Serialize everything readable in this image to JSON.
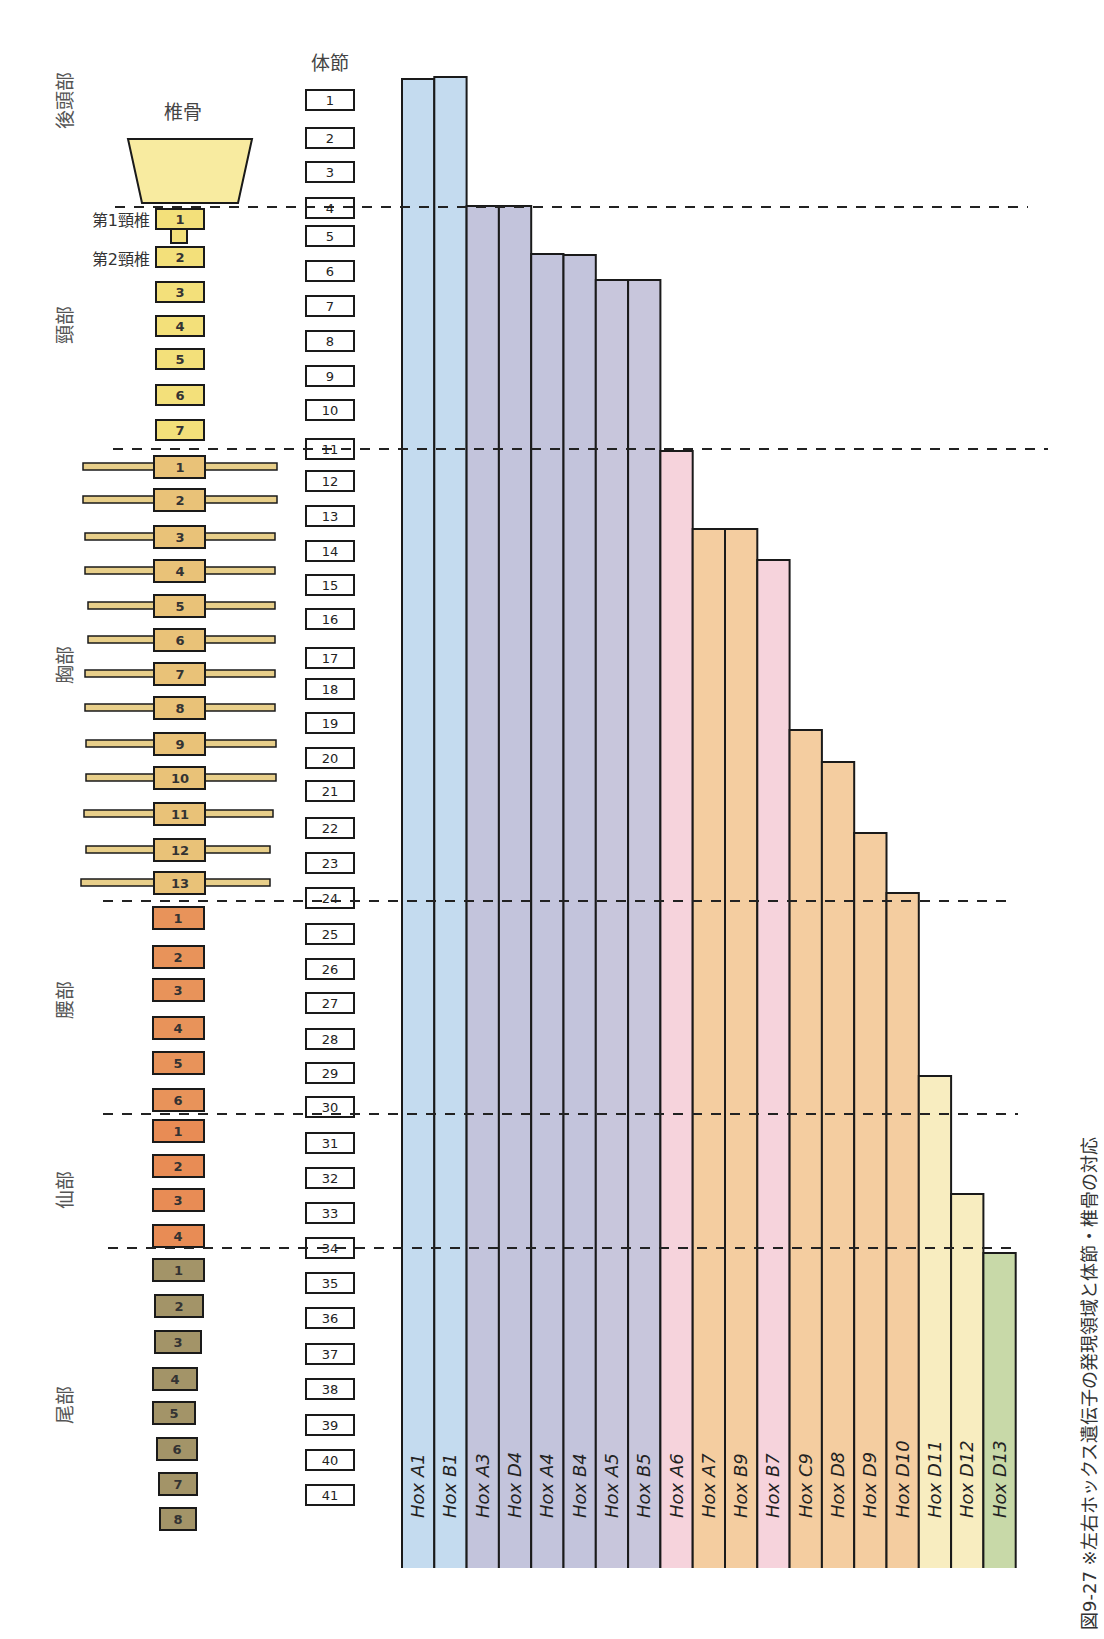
{
  "headers": {
    "vertebra_column": "椎骨",
    "segment_column": "体節"
  },
  "cervical_labels": {
    "c1": "第1頸椎",
    "c2": "第2頸椎"
  },
  "caption_fragment": "図9-27 ※左右ホックス遺伝子の発現領域と体節・椎骨の対応",
  "colors": {
    "occipital": "#f8eba0",
    "cervical": "#f3e07a",
    "thoracic": "#e9c278",
    "lumbar": "#e8935a",
    "sacral": "#e88c55",
    "caudal": "#a39468",
    "rib": "#e8cf8a",
    "hox1": "#c4dbef",
    "hox3_5": "#c3c4dc",
    "hox6_7": "#f6d3dc",
    "hox_orange": "#f4cda0",
    "hox_d11_12": "#f8edc0",
    "hox_d13": "#c8d9a8",
    "outline": "#1a1a1a"
  },
  "regions": [
    {
      "name": "後頭部",
      "first_segment": 1,
      "last_segment": 4
    },
    {
      "name": "頸部",
      "first_segment": 5,
      "last_segment": 11
    },
    {
      "name": "胸部",
      "first_segment": 12,
      "last_segment": 24
    },
    {
      "name": "腰部",
      "first_segment": 25,
      "last_segment": 30
    },
    {
      "name": "仙部",
      "first_segment": 31,
      "last_segment": 34
    },
    {
      "name": "尾部",
      "first_segment": 35,
      "last_segment": 41
    }
  ],
  "vertebrae": {
    "cervical": [
      "1",
      "2",
      "3",
      "4",
      "5",
      "6",
      "7"
    ],
    "thoracic": [
      "1",
      "2",
      "3",
      "4",
      "5",
      "6",
      "7",
      "8",
      "9",
      "10",
      "11",
      "12",
      "13"
    ],
    "lumbar": [
      "1",
      "2",
      "3",
      "4",
      "5",
      "6"
    ],
    "sacral": [
      "1",
      "2",
      "3",
      "4"
    ],
    "caudal": [
      "1",
      "2",
      "3",
      "4",
      "5",
      "6",
      "7",
      "8"
    ]
  },
  "segments": [
    "1",
    "2",
    "3",
    "4",
    "5",
    "6",
    "7",
    "8",
    "9",
    "10",
    "11",
    "12",
    "13",
    "14",
    "15",
    "16",
    "17",
    "18",
    "19",
    "20",
    "21",
    "22",
    "23",
    "24",
    "25",
    "26",
    "27",
    "28",
    "29",
    "30",
    "31",
    "32",
    "33",
    "34",
    "35",
    "36",
    "37",
    "38",
    "39",
    "40",
    "41"
  ],
  "boundaries": [
    4,
    11,
    24,
    30,
    34
  ],
  "chart_data": {
    "type": "bar",
    "title": "",
    "xlabel": "Hox遺伝子",
    "ylabel": "体節 (anterior expression limit)",
    "orientation": "vertical bars hanging from posterior end; bar top = anterior limit segment",
    "categories": [
      "Hox A1",
      "Hox B1",
      "Hox A3",
      "Hox D4",
      "Hox A4",
      "Hox B4",
      "Hox A5",
      "Hox B5",
      "Hox A6",
      "Hox A7",
      "Hox B9",
      "Hox B7",
      "Hox C9",
      "Hox D8",
      "Hox D9",
      "Hox D10",
      "Hox D11",
      "Hox D12",
      "Hox D13"
    ],
    "values": [
      1,
      1,
      4,
      4,
      6,
      6,
      7,
      7,
      11,
      14,
      14,
      15,
      20,
      21,
      23,
      24,
      31,
      34,
      35
    ],
    "series_colors": [
      "#c4dbef",
      "#c4dbef",
      "#c3c4dc",
      "#c3c4dc",
      "#c3c4dc",
      "#c3c4dc",
      "#c8c6dc",
      "#c8c6dc",
      "#f6d3dc",
      "#f4cda0",
      "#f4cda0",
      "#f6d3dc",
      "#f4cda0",
      "#f4cda0",
      "#f4cda0",
      "#f4cda0",
      "#f8edc0",
      "#f8edc0",
      "#c8d9a8"
    ],
    "ylim": [
      1,
      41
    ],
    "grid": false,
    "reference_lines": [
      {
        "after_segment": 4,
        "label": "後頭部/頸部"
      },
      {
        "after_segment": 11,
        "label": "頸部/胸部"
      },
      {
        "after_segment": 24,
        "label": "胸部/腰部"
      },
      {
        "after_segment": 30,
        "label": "腰部/仙部"
      },
      {
        "after_segment": 34,
        "label": "仙部/尾部"
      }
    ],
    "legend": "none"
  }
}
